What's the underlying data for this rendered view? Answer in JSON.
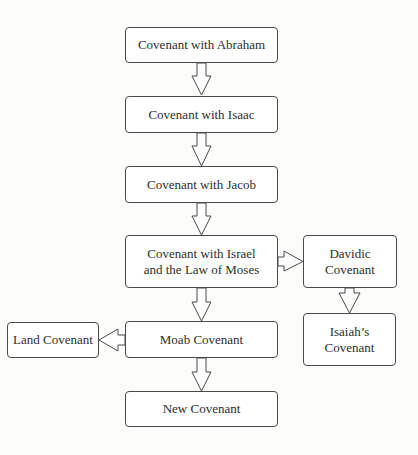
{
  "diagram": {
    "type": "flowchart",
    "nodes": [
      {
        "id": "abraham",
        "label": "Covenant with Abraham"
      },
      {
        "id": "isaac",
        "label": "Covenant with Isaac"
      },
      {
        "id": "jacob",
        "label": "Covenant with Jacob"
      },
      {
        "id": "israel",
        "label": "Covenant with Israel\nand the Law of Moses"
      },
      {
        "id": "davidic",
        "label": "Davidic\nCovenant"
      },
      {
        "id": "isaiah",
        "label": "Isaiah’s\nCovenant"
      },
      {
        "id": "moab",
        "label": "Moab Covenant"
      },
      {
        "id": "land",
        "label": "Land Covenant"
      },
      {
        "id": "new",
        "label": "New Covenant"
      }
    ],
    "edges": [
      {
        "from": "abraham",
        "to": "isaac",
        "arrow": "block-arrow-down"
      },
      {
        "from": "isaac",
        "to": "jacob",
        "arrow": "block-arrow-down"
      },
      {
        "from": "jacob",
        "to": "israel",
        "arrow": "block-arrow-down"
      },
      {
        "from": "israel",
        "to": "davidic",
        "arrow": "block-arrow-right"
      },
      {
        "from": "davidic",
        "to": "isaiah",
        "arrow": "block-arrow-down"
      },
      {
        "from": "israel",
        "to": "moab",
        "arrow": "block-arrow-down"
      },
      {
        "from": "moab",
        "to": "land",
        "arrow": "block-arrow-left"
      },
      {
        "from": "moab",
        "to": "new",
        "arrow": "block-arrow-down"
      }
    ]
  }
}
